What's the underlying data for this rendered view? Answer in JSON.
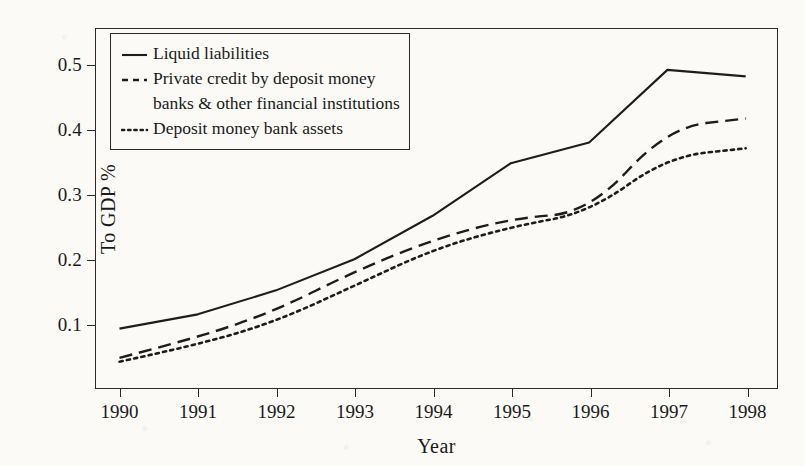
{
  "chart_data": {
    "type": "line",
    "title": "",
    "xlabel": "Year",
    "ylabel": "To GDP %",
    "categories": [
      "1990",
      "1991",
      "1992",
      "1993",
      "1994",
      "1995",
      "1996",
      "1997",
      "1998"
    ],
    "x": [
      1990,
      1991,
      1992,
      1993,
      1994,
      1995,
      1996,
      1997,
      1998
    ],
    "xlim": [
      1989.7,
      1998.4
    ],
    "ylim": [
      0.0,
      0.555
    ],
    "xticks": [
      "1990",
      "1991",
      "1992",
      "1993",
      "1994",
      "1995",
      "1996",
      "1997",
      "1998"
    ],
    "yticks": [
      "0.1",
      "0.2",
      "0.3",
      "0.4",
      "0.5"
    ],
    "ytick_values": [
      0.1,
      0.2,
      0.3,
      0.4,
      0.5
    ],
    "grid": false,
    "legend_position": "top-left",
    "series": [
      {
        "name": "Liquid liabilities",
        "style": "solid",
        "values": [
          0.093,
          0.115,
          0.152,
          0.2,
          0.267,
          0.348,
          0.38,
          0.492,
          0.482
        ]
      },
      {
        "name": "Private credit by deposit money banks & other financial institutions",
        "style": "dashed",
        "values": [
          0.048,
          0.079,
          0.121,
          0.181,
          0.23,
          0.263,
          0.272,
          0.403,
          0.417
        ]
      },
      {
        "name": "Deposit money bank assets",
        "style": "dotted",
        "values": [
          0.042,
          0.068,
          0.104,
          0.159,
          0.215,
          0.25,
          0.272,
          0.358,
          0.371
        ]
      }
    ],
    "legend": [
      {
        "line1": "Liquid liabilities",
        "line2": "",
        "style": "solid"
      },
      {
        "line1": "Private credit by deposit money",
        "line2": "banks & other financial institutions",
        "style": "dashed"
      },
      {
        "line1": "Deposit money bank assets",
        "line2": "",
        "style": "dotted"
      }
    ],
    "colors": {
      "line": "#1d1d1d",
      "axis": "#2a2a2a",
      "background": "#fbfaf7"
    }
  }
}
